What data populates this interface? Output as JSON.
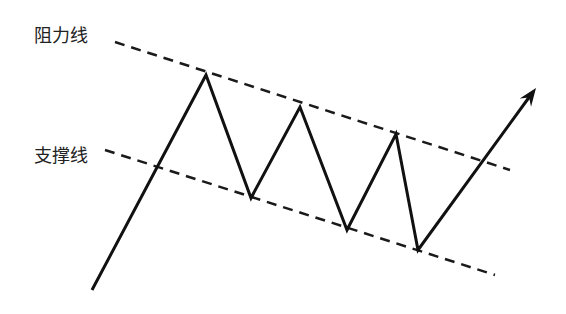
{
  "diagram": {
    "title": "",
    "labels": {
      "resistance": "阻力线",
      "support": "支撑线"
    },
    "colors": {
      "line": "#111111",
      "dashed": "#1a1a1a",
      "background": "#ffffff"
    },
    "resistance_line": {
      "x1": 115,
      "y1": 42,
      "x2": 510,
      "y2": 170
    },
    "support_line": {
      "x1": 105,
      "y1": 150,
      "x2": 495,
      "y2": 275
    },
    "price_path": [
      [
        92,
        290
      ],
      [
        206,
        75
      ],
      [
        251,
        198
      ],
      [
        300,
        107
      ],
      [
        347,
        230
      ],
      [
        396,
        134
      ],
      [
        418,
        250
      ],
      [
        530,
        96
      ]
    ],
    "arrow_tip": [
      536,
      88
    ]
  }
}
